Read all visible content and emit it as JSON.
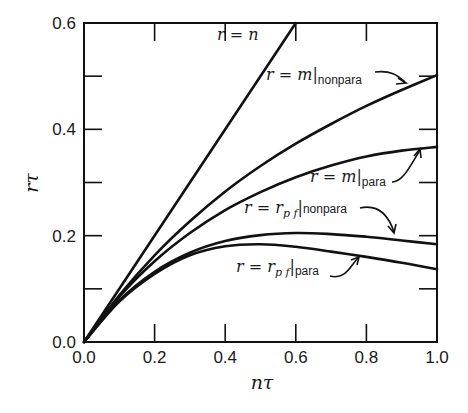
{
  "chart_data": {
    "type": "line",
    "title": "",
    "xlabel": "nτ",
    "ylabel": "rτ",
    "xlim": [
      0.0,
      1.0
    ],
    "ylim": [
      0.0,
      0.6
    ],
    "grid": false,
    "legend": "inline annotations with arrows",
    "x_ticks": [
      "0.0",
      "0.2",
      "0.4",
      "0.6",
      "0.8",
      "1.0"
    ],
    "y_ticks": [
      "0.0",
      "0.2",
      "0.4",
      "0.6"
    ],
    "x_minor_ticks": [
      0.2,
      0.4,
      0.6,
      0.8
    ],
    "y_minor_ticks": [
      0.1,
      0.2,
      0.3,
      0.4,
      0.5
    ],
    "series": [
      {
        "name": "r = n",
        "x": [
          0.0,
          0.6
        ],
        "values": [
          0.0,
          0.6
        ]
      },
      {
        "name": "r = m|nonpara",
        "x": [
          0.0,
          0.1,
          0.2,
          0.3,
          0.4,
          0.5,
          0.6,
          0.7,
          0.8,
          0.9,
          1.0
        ],
        "values": [
          0.0,
          0.088,
          0.163,
          0.227,
          0.283,
          0.331,
          0.373,
          0.41,
          0.444,
          0.474,
          0.502
        ]
      },
      {
        "name": "r = m|para",
        "x": [
          0.0,
          0.1,
          0.2,
          0.3,
          0.4,
          0.5,
          0.6,
          0.7,
          0.8,
          0.9,
          1.0
        ],
        "values": [
          0.0,
          0.085,
          0.152,
          0.205,
          0.248,
          0.282,
          0.31,
          0.332,
          0.349,
          0.36,
          0.367
        ]
      },
      {
        "name": "r = r_pf|nonpara",
        "x": [
          0.0,
          0.1,
          0.2,
          0.3,
          0.4,
          0.5,
          0.6,
          0.7,
          0.8,
          0.9,
          1.0
        ],
        "values": [
          0.0,
          0.078,
          0.132,
          0.168,
          0.19,
          0.201,
          0.205,
          0.203,
          0.198,
          0.191,
          0.184
        ]
      },
      {
        "name": "r = r_pf|para",
        "x": [
          0.0,
          0.1,
          0.2,
          0.3,
          0.4,
          0.5,
          0.6,
          0.7,
          0.8,
          0.9,
          1.0
        ],
        "values": [
          0.0,
          0.076,
          0.128,
          0.163,
          0.18,
          0.184,
          0.179,
          0.17,
          0.16,
          0.149,
          0.137
        ]
      }
    ],
    "annotations": [
      {
        "text": "r = n",
        "x": 0.38,
        "y": 0.575,
        "target_series": "r = n"
      },
      {
        "text": "r = m|nonpara",
        "x": 0.5,
        "y": 0.505,
        "arrow_to": [
          0.92,
          0.48
        ]
      },
      {
        "text": "r = m|para",
        "x": 0.66,
        "y": 0.305,
        "arrow_to": [
          0.95,
          0.365
        ]
      },
      {
        "text": "r = r_pf|nonpara",
        "x": 0.45,
        "y": 0.245,
        "arrow_to": [
          0.93,
          0.19
        ]
      },
      {
        "text": "r = r_pf|para",
        "x": 0.44,
        "y": 0.125,
        "arrow_to": [
          0.83,
          0.158
        ]
      }
    ]
  },
  "labels": {
    "xlabel": "nτ",
    "ylabel": "rτ",
    "x_ticks": [
      "0.0",
      "0.2",
      "0.4",
      "0.6",
      "0.8",
      "1.0"
    ],
    "y_ticks": [
      "0.0",
      "0.2",
      "0.4",
      "0.6"
    ],
    "ann_rn": "r = n",
    "ann_m_main": "r = m",
    "ann_m_nonpara_sub": "nonpara",
    "ann_m_para_sub": "para",
    "ann_pf_main": "r = r",
    "ann_pf_sub": "p f",
    "ann_pf_nonpara_sub": "nonpara",
    "ann_pf_para_sub": "para",
    "bar": "|"
  }
}
